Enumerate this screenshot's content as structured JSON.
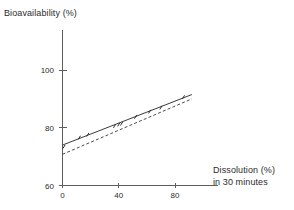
{
  "figure": {
    "y_axis_caption": "Bioavailability (%)",
    "x_axis_caption_line1": "Dissolution (%)",
    "x_axis_caption_line2": "in 30 minutes"
  },
  "chart_data": {
    "type": "line",
    "title": "",
    "xlabel": "Dissolution (%) in 30 minutes",
    "ylabel": "Bioavailability (%)",
    "xlim": [
      0,
      110
    ],
    "ylim": [
      60,
      110
    ],
    "xticks": [
      0,
      40,
      80
    ],
    "xticklabels": [
      "0",
      "40",
      "80"
    ],
    "yticks": [
      60,
      80,
      100
    ],
    "yticklabels": [
      "60",
      "80",
      "100"
    ],
    "grid": false,
    "legend": "none",
    "series": [
      {
        "name": "regression-line-solid",
        "style": "solid",
        "color": "#3a3a3a",
        "x": [
          0,
          92
        ],
        "y": [
          74.0,
          91.5
        ]
      },
      {
        "name": "regression-line-dashed",
        "style": "dashed",
        "color": "#4a4a4a",
        "x": [
          0,
          92
        ],
        "y": [
          70.8,
          90.0
        ]
      }
    ],
    "points": [
      {
        "x": 1.0,
        "y": 73.4
      },
      {
        "x": 12.0,
        "y": 76.6
      },
      {
        "x": 18.0,
        "y": 77.6
      },
      {
        "x": 37.0,
        "y": 80.6
      },
      {
        "x": 40.0,
        "y": 81.1
      },
      {
        "x": 42.0,
        "y": 81.4
      },
      {
        "x": 52.0,
        "y": 83.8
      },
      {
        "x": 62.0,
        "y": 85.6
      },
      {
        "x": 70.0,
        "y": 87.0
      },
      {
        "x": 86.0,
        "y": 90.6
      }
    ]
  }
}
